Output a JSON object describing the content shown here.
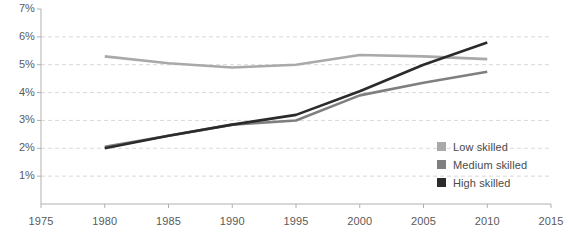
{
  "chart_data": {
    "type": "line",
    "title": "",
    "subtitle": "",
    "xlabel": "",
    "ylabel": "",
    "xlim": [
      1975,
      2015
    ],
    "ylim": [
      0,
      7
    ],
    "x_ticks": [
      1975,
      1980,
      1985,
      1990,
      1995,
      2000,
      2005,
      2010,
      2015
    ],
    "x_tick_labels": [
      "1975",
      "1980",
      "1985",
      "1990",
      "1995",
      "2000",
      "2005",
      "2010",
      "2015"
    ],
    "y_ticks": [
      1,
      2,
      3,
      4,
      5,
      6,
      7
    ],
    "y_tick_labels": [
      "1%",
      "2%",
      "3%",
      "4%",
      "5%",
      "6%",
      "7%"
    ],
    "grid": "horizontal-dashed",
    "legend_position": "right-bottom",
    "x": [
      1980,
      1985,
      1990,
      1995,
      2000,
      2005,
      2010
    ],
    "series": [
      {
        "name": "Low skilled",
        "color": "#a9a9a9",
        "values": [
          5.3,
          5.05,
          4.9,
          5.0,
          5.35,
          5.3,
          5.2
        ]
      },
      {
        "name": "Medium skilled",
        "color": "#7f7f7f",
        "values": [
          2.05,
          2.45,
          2.85,
          3.0,
          3.9,
          4.35,
          4.75
        ]
      },
      {
        "name": "High skilled",
        "color": "#2b2b2b",
        "values": [
          2.0,
          2.45,
          2.85,
          3.2,
          4.05,
          5.0,
          5.8
        ]
      }
    ]
  },
  "legend": {
    "items": [
      {
        "label": "Low skilled",
        "color": "#a9a9a9"
      },
      {
        "label": "Medium skilled",
        "color": "#7f7f7f"
      },
      {
        "label": "High skilled",
        "color": "#2b2b2b"
      }
    ]
  },
  "axes": {
    "axis_color": "#b0b0b0",
    "grid_color": "#d9d9d9",
    "tick_text_color": "#5a5a5a"
  }
}
